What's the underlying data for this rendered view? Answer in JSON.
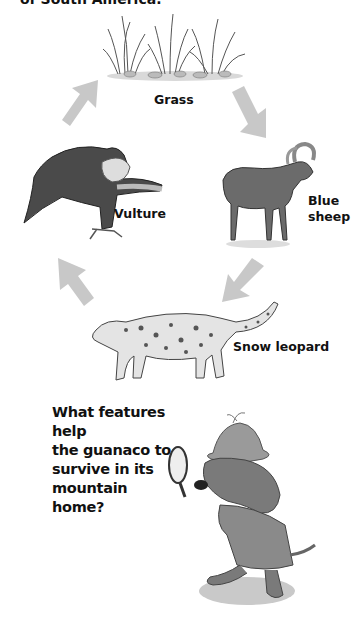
{
  "page": {
    "intro_fragment": "of South America.",
    "food_chain": {
      "title": "",
      "nodes": [
        {
          "id": "grass",
          "label": "Grass"
        },
        {
          "id": "blue-sheep",
          "label_line1": "Blue",
          "label_line2": "sheep"
        },
        {
          "id": "snow-leopard",
          "label": "Snow leopard"
        },
        {
          "id": "vulture",
          "label": "Vulture"
        }
      ],
      "arrow_color": "#c8c8c8",
      "arrows": [
        "grass-to-blue-sheep",
        "blue-sheep-to-snow-leopard",
        "snow-leopard-to-vulture",
        "vulture-to-grass"
      ]
    },
    "question": {
      "line1": "What features help",
      "line2": "the guanaco to",
      "line3": "survive in its",
      "line4": "mountain",
      "line5": "home?"
    }
  }
}
